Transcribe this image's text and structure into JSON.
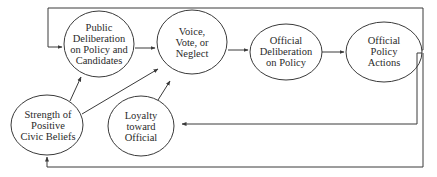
{
  "diagram": {
    "nodes": {
      "public_deliberation": {
        "lines": [
          "Public",
          "Deliberation",
          "on Policy and",
          "Candidates"
        ]
      },
      "voice_vote_neglect": {
        "lines": [
          "Voice,",
          "Vote, or",
          "Neglect"
        ]
      },
      "official_deliberation": {
        "lines": [
          "Official",
          "Deliberation",
          "on Policy"
        ]
      },
      "official_policy_actions": {
        "lines": [
          "Official",
          "Policy",
          "Actions"
        ]
      },
      "civic_beliefs": {
        "lines": [
          "Strength of",
          "Positive",
          "Civic Beliefs"
        ]
      },
      "loyalty": {
        "lines": [
          "Loyalty",
          "toward",
          "Official"
        ]
      }
    },
    "edges": [
      {
        "from": "public_deliberation",
        "to": "voice_vote_neglect"
      },
      {
        "from": "voice_vote_neglect",
        "to": "official_deliberation"
      },
      {
        "from": "official_deliberation",
        "to": "official_policy_actions"
      },
      {
        "from": "civic_beliefs",
        "to": "public_deliberation"
      },
      {
        "from": "civic_beliefs",
        "to": "voice_vote_neglect"
      },
      {
        "from": "loyalty",
        "to": "voice_vote_neglect"
      },
      {
        "from": "official_policy_actions",
        "to": "public_deliberation",
        "route": "feedback-top"
      },
      {
        "from": "official_policy_actions",
        "to": "loyalty",
        "route": "feedback-right"
      },
      {
        "from": "official_policy_actions",
        "to": "civic_beliefs",
        "route": "feedback-bottom"
      }
    ],
    "colors": {
      "line": "#3a3a3a",
      "text": "#2a2a2a",
      "background": "#ffffff"
    }
  }
}
